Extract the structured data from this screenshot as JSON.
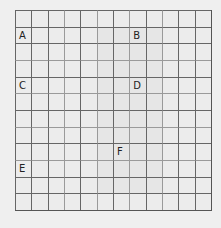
{
  "grid": {
    "columns": 12,
    "rows": 12,
    "line_color": "#555555",
    "background": "#efefef",
    "labels": [
      {
        "id": "A",
        "text": "A",
        "row": 1,
        "col": 0
      },
      {
        "id": "B",
        "text": "B",
        "row": 1,
        "col": 7
      },
      {
        "id": "C",
        "text": "C",
        "row": 4,
        "col": 0
      },
      {
        "id": "D",
        "text": "D",
        "row": 4,
        "col": 7
      },
      {
        "id": "F",
        "text": "F",
        "row": 8,
        "col": 6
      },
      {
        "id": "E",
        "text": "E",
        "row": 9,
        "col": 0
      }
    ]
  }
}
